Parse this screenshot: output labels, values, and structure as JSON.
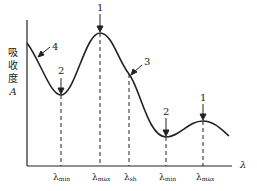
{
  "diagram": {
    "title": "",
    "y_axis_label": [
      "吸",
      "收",
      "度",
      "A"
    ],
    "x_axis_label": "λ",
    "x_ticks": [
      {
        "sym": "λ",
        "sub": "min"
      },
      {
        "sym": "λ",
        "sub": "max"
      },
      {
        "sym": "λ",
        "sub": "sh"
      },
      {
        "sym": "λ",
        "sub": "min"
      },
      {
        "sym": "λ",
        "sub": "max"
      }
    ],
    "markers": [
      "4",
      "2",
      "1",
      "3",
      "2",
      "1"
    ],
    "colors": {
      "line": "#222222",
      "background": "#ffffff"
    }
  }
}
